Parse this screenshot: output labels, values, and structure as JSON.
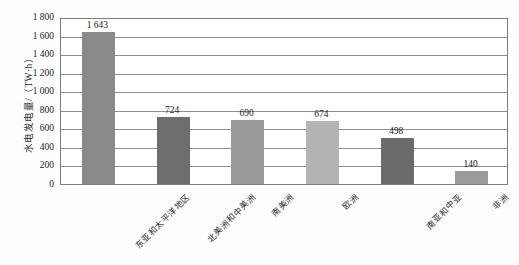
{
  "chart_data": {
    "type": "bar",
    "title": "",
    "subtitle": "",
    "xlabel": "",
    "ylabel": "水电发电量/（TW·h）",
    "ylim": [
      0,
      1800
    ],
    "ytick_values": [
      0,
      200,
      400,
      600,
      800,
      1000,
      1200,
      1400,
      1600,
      1800
    ],
    "ytick_labels": [
      "0",
      "200",
      "400",
      "600",
      "800",
      "1 000",
      "1 200",
      "1 400",
      "1 600",
      "1 800"
    ],
    "grid": "horizontal",
    "legend": "none",
    "categories": [
      "东亚和太平洋地区",
      "北美洲和中美洲",
      "南美洲",
      "欧洲",
      "南亚和中亚",
      "非洲"
    ],
    "values": [
      1643,
      724,
      690,
      674,
      498,
      140
    ],
    "value_labels": [
      "1 643",
      "724",
      "690",
      "674",
      "498",
      "140"
    ],
    "bar_colors": [
      "#8a8a8a",
      "#6e6e6e",
      "#9a9a9a",
      "#b4b4b4",
      "#6b6b6b",
      "#9b9b9b"
    ],
    "frame_color": "#7b7b7b",
    "gridline_color": "#8f8f8f",
    "background_color": "#ffffff"
  }
}
